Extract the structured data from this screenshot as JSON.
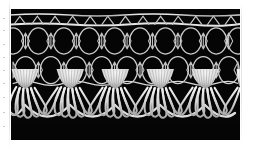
{
  "page": {
    "background_color": "#ffffff",
    "width": 253,
    "height": 150
  },
  "photo": {
    "name": "lace-trim-photograph",
    "alt_text": "White lace trim with honeycomb mesh net and five scalloped fan tassels on a black background",
    "background_color": "#050505",
    "thread_color": "#e8e8e8",
    "thread_shadow_color": "#9a9a9a",
    "frame": {
      "x": 11,
      "y": 9,
      "width": 229,
      "height": 131
    },
    "subject": "lace trim sample",
    "technique": "bobbin lace"
  },
  "lace": {
    "header_band": {
      "name": "straight-heading-band",
      "rail_count": 2,
      "rail_y": [
        6,
        15
      ],
      "node_count": 13,
      "node_spacing": 17.6
    },
    "mesh": {
      "name": "honeycomb-mesh-net",
      "ring_rows": 2,
      "ring_row_y": [
        32,
        62
      ],
      "rings_per_row": 9,
      "ring_spacing": 25.4,
      "ring_radius_x": 11,
      "ring_radius_y": 13,
      "connector_name": "bowtie-connector",
      "connector_count": 18
    },
    "scallops": {
      "name": "fan-tassel-row",
      "count": 5,
      "centers_x": [
        14,
        59,
        104,
        149,
        194
      ],
      "spacing": 45,
      "head_top_y": 60,
      "head_width": 30,
      "head_height": 18,
      "petal_count": 7,
      "petal_bottom_y": 118,
      "rib_count": 11
    },
    "ground_arcs": {
      "name": "connecting-arc",
      "count": 4,
      "dip_depth": 12
    }
  },
  "margin_artifacts": {
    "name": "scan-edge-speckle",
    "count": 9,
    "positions_y": [
      18,
      30,
      44,
      57,
      70,
      83,
      97,
      112,
      126
    ],
    "color": "#c9c9c9"
  }
}
